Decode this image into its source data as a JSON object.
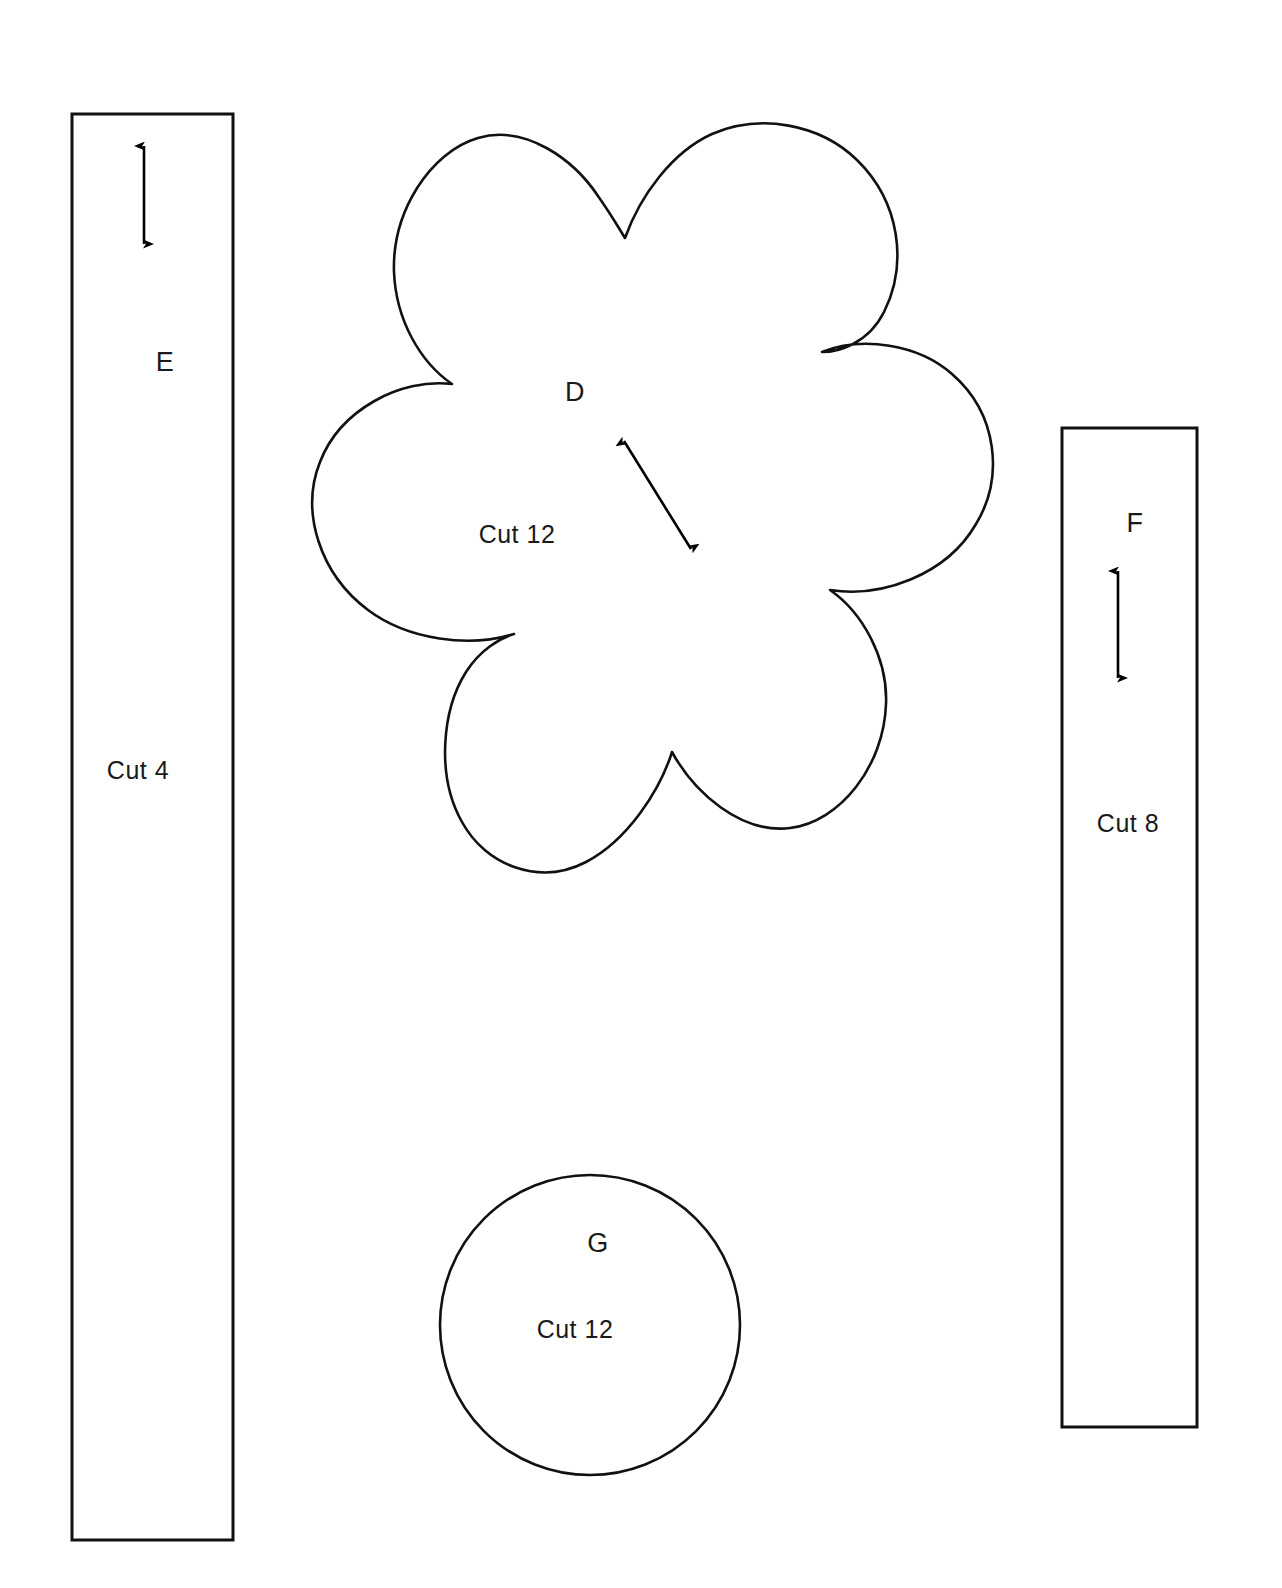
{
  "document": {
    "type": "sewing-pattern-template-sheet",
    "background_color": "#ffffff",
    "ink_color": "#000000",
    "width": 1282,
    "height": 1588
  },
  "pieces": [
    {
      "id": "E",
      "shape": "rectangle",
      "letter": "E",
      "cut_instruction": "Cut 4",
      "grainline": "vertical-double-arrow",
      "bounds": {
        "x": 72,
        "y": 114,
        "width": 161,
        "height": 1426
      },
      "letter_position": {
        "x": 165,
        "y": 362
      },
      "cut_position": {
        "x": 138,
        "y": 770
      },
      "arrow": {
        "x": 144,
        "y1": 143,
        "y2": 247
      }
    },
    {
      "id": "D",
      "shape": "six-petal-flower",
      "letter": "D",
      "cut_instruction": "Cut 12",
      "grainline": "diagonal-double-arrow",
      "bounds": {
        "x": 283,
        "y": 128,
        "width": 717,
        "height": 740
      },
      "letter_position": {
        "x": 575,
        "y": 392
      },
      "cut_position": {
        "x": 517,
        "y": 534
      },
      "arrow": {
        "x1": 621,
        "y1": 437,
        "x2": 694,
        "y2": 553
      }
    },
    {
      "id": "F",
      "shape": "rectangle",
      "letter": "F",
      "cut_instruction": "Cut 8",
      "grainline": "vertical-double-arrow",
      "bounds": {
        "x": 1062,
        "y": 428,
        "width": 135,
        "height": 999
      },
      "letter_position": {
        "x": 1135,
        "y": 523
      },
      "cut_position": {
        "x": 1128,
        "y": 823
      },
      "arrow": {
        "x": 1118,
        "y1": 568,
        "y2": 681
      }
    },
    {
      "id": "G",
      "shape": "circle",
      "letter": "G",
      "cut_instruction": "Cut 12",
      "grainline": "none",
      "center": {
        "x": 590,
        "y": 1325
      },
      "radius": 150,
      "letter_position": {
        "x": 598,
        "y": 1243
      },
      "cut_position": {
        "x": 575,
        "y": 1329
      }
    }
  ],
  "labels": {
    "piece_e_letter": "E",
    "piece_e_cut": "Cut 4",
    "piece_d_letter": "D",
    "piece_d_cut": "Cut 12",
    "piece_f_letter": "F",
    "piece_f_cut": "Cut 8",
    "piece_g_letter": "G",
    "piece_g_cut": "Cut 12"
  }
}
